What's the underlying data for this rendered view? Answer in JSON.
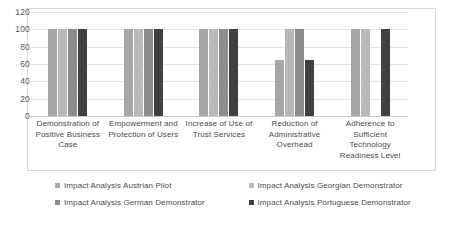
{
  "chart_data": {
    "type": "bar",
    "title": "",
    "subtitle": "",
    "xlabel": "",
    "ylabel": "",
    "ylim": [
      0,
      120
    ],
    "ytick_step": 20,
    "yticks": [
      120,
      100,
      80,
      60,
      40,
      20,
      0
    ],
    "grid": true,
    "legend_position": "bottom",
    "categories": [
      "Demonstration of Positive Business Case",
      "Empowerment and Protection of Users",
      "Increase of Use of Trust Services",
      "Reduction of Administrative Overhead",
      "Adherence to Sufficient Technology Readiness Level"
    ],
    "series": [
      {
        "name": "Impact Analysis Austrian Pilot",
        "color": "#a6a6a6",
        "values": [
          100,
          100,
          100,
          65,
          100
        ]
      },
      {
        "name": "Impact Analysis Georgian Demonstrator",
        "color": "#b8b8b8",
        "values": [
          100,
          100,
          100,
          100,
          100
        ]
      },
      {
        "name": "Impact Analysis German Demonstrator",
        "color": "#8c8c8c",
        "values": [
          100,
          100,
          100,
          100,
          0
        ]
      },
      {
        "name": "Impact Analysis Portuguese Demonstrator",
        "color": "#404040",
        "values": [
          100,
          100,
          100,
          65,
          100
        ]
      }
    ]
  },
  "axis": {
    "y_tick_labels": [
      "120",
      "100",
      "80",
      "60",
      "40",
      "20",
      "0"
    ],
    "category_labels": [
      "Demonstration of Positive Business Case",
      "Empowerment and Protection of Users",
      "Increase of Use of Trust Services",
      "Reduction of Administrative Overhead",
      "Adherence to Sufficient Technology Readiness Level"
    ]
  },
  "legend": {
    "items": [
      {
        "label": "Impact Analysis Austrian Pilot",
        "color": "#a6a6a6"
      },
      {
        "label": "Impact Analysis Georgian Demonstrator",
        "color": "#b8b8b8"
      },
      {
        "label": "Impact Analysis German Demonstrator",
        "color": "#8c8c8c"
      },
      {
        "label": "Impact Analysis Portuguese Demonstrator",
        "color": "#404040"
      }
    ]
  },
  "colors": {
    "gridline": "#e4e4e4",
    "frame": "#d9d9d9",
    "text": "#4a4a4a",
    "background": "#ffffff"
  }
}
